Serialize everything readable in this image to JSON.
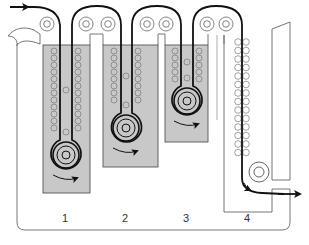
{
  "diagram": {
    "type": "film-processor-schematic",
    "colors": {
      "tank_fill": "#c8c8c8",
      "outline": "#555555",
      "film_path": "#111111",
      "background": "#ffffff"
    },
    "tanks": [
      {
        "id": "1",
        "label": "1",
        "x": 43,
        "y": 45,
        "w": 47,
        "h": 148,
        "roller": {
          "cx": 66,
          "cy": 155
        },
        "roller_rows": 12
      },
      {
        "id": "2",
        "label": "2",
        "x": 103,
        "y": 45,
        "w": 55,
        "h": 122,
        "roller": {
          "cx": 126,
          "cy": 128
        },
        "roller_rows": 8
      },
      {
        "id": "3",
        "label": "3",
        "x": 165,
        "y": 45,
        "w": 43,
        "h": 97,
        "roller": {
          "cx": 187,
          "cy": 101
        },
        "roller_rows": 5
      },
      {
        "id": "4",
        "label": "4",
        "dryer": true,
        "roller_rows": 14
      }
    ],
    "labels": [
      {
        "text": "1",
        "x": 65,
        "y": 212
      },
      {
        "text": "2",
        "x": 125,
        "y": 212
      },
      {
        "text": "3",
        "x": 186,
        "y": 212
      },
      {
        "text": "4",
        "x": 247,
        "y": 212
      }
    ],
    "top_rollers": [
      47,
      86,
      108,
      147,
      166,
      207,
      226
    ],
    "arrows": {
      "input": "film-in-arrow",
      "output": "film-out-arrow",
      "rotation": "roller-rotation-arrow"
    }
  }
}
